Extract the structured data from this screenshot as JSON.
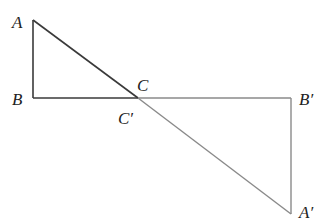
{
  "diagram": {
    "type": "geometry",
    "colors": {
      "triangle1": "#3a3a3a",
      "triangle2": "#8a8a8a",
      "label": "#222222"
    },
    "points": {
      "A": {
        "label": "A",
        "x": 33,
        "y": 20
      },
      "B": {
        "label": "B",
        "x": 33,
        "y": 98
      },
      "C": {
        "label": "C",
        "x": 138,
        "y": 98
      },
      "B_prime": {
        "label": "B′",
        "x": 291,
        "y": 98
      },
      "A_prime": {
        "label": "A′",
        "x": 291,
        "y": 214
      }
    },
    "labels": {
      "A": "A",
      "B": "B",
      "C": "C",
      "C_prime": "C′",
      "B_prime": "B′",
      "A_prime": "A′"
    },
    "triangles": [
      {
        "name": "ABC",
        "vertices": [
          "A",
          "B",
          "C"
        ]
      },
      {
        "name": "A′B′C′",
        "vertices": [
          "A′",
          "B′",
          "C′"
        ]
      }
    ]
  }
}
